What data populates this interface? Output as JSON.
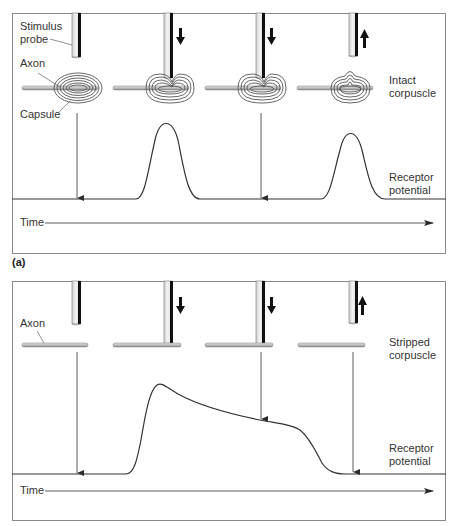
{
  "panels": [
    {
      "id": "a",
      "tag": "(a)",
      "labels": {
        "stimulus_probe_line1": "Stimulus",
        "stimulus_probe_line2": "probe",
        "axon": "Axon",
        "capsule": "Capsule",
        "corpuscle_line1": "Intact",
        "corpuscle_line2": "corpuscle",
        "receptor_line1": "Receptor",
        "receptor_line2": "potential",
        "time": "Time"
      },
      "stages": [
        {
          "probe": "rest",
          "arrow": "none",
          "response": "none"
        },
        {
          "probe": "pressing",
          "arrow": "down",
          "response": "transient peak"
        },
        {
          "probe": "held",
          "arrow": "down",
          "response": "none"
        },
        {
          "probe": "released",
          "arrow": "up",
          "response": "transient peak"
        }
      ]
    },
    {
      "id": "b",
      "tag": "(b)",
      "labels": {
        "axon": "Axon",
        "corpuscle_line1": "Stripped",
        "corpuscle_line2": "corpuscle",
        "receptor_line1": "Receptor",
        "receptor_line2": "potential",
        "time": "Time"
      },
      "stages": [
        {
          "probe": "rest",
          "arrow": "none",
          "response": "none"
        },
        {
          "probe": "pressing",
          "arrow": "down",
          "response": "rapid rise"
        },
        {
          "probe": "held",
          "arrow": "down",
          "response": "slow decay (sustained)"
        },
        {
          "probe": "released",
          "arrow": "up",
          "response": "return to baseline"
        }
      ]
    }
  ],
  "colors": {
    "line": "#3a3a3a",
    "frame": "#8a8a8a",
    "probe_fill": "#e6e6e6",
    "probe_edge": "#111111",
    "capsule": "#555555"
  }
}
